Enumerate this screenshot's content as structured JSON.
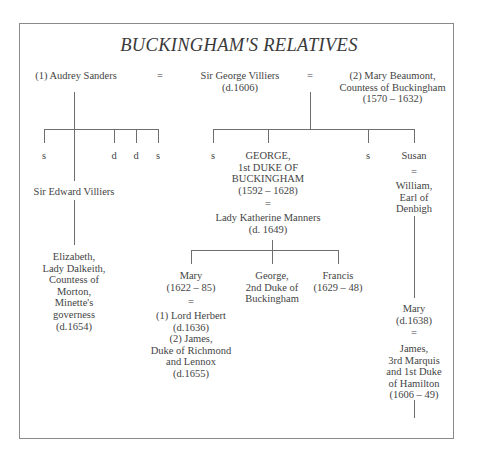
{
  "title": "BUCKINGHAM'S RELATIVES",
  "generation1": {
    "wife1": "(1) Audrey Sanders",
    "marriage1": "=",
    "husband": "Sir George Villiers\n(d.1606)",
    "marriage2": "=",
    "wife2": "(2) Mary Beaumont,\nCountess of Buckingham\n(1570 – 1632)"
  },
  "children_first_marriage": [
    "s",
    "d",
    "d",
    "s"
  ],
  "sir_edward": "Sir Edward Villiers",
  "elizabeth": "Elizabeth,\nLady Dalkeith,\nCountess of\nMorton,\nMinette's\ngoverness\n(d.1654)",
  "children_second_marriage": {
    "s1": "s",
    "george": "GEORGE,\n1st DUKE OF\nBUCKINGHAM\n(1592 – 1628)",
    "s2": "s",
    "susan": "Susan"
  },
  "george_marriage": "=",
  "katherine": "Lady Katherine Manners\n(d. 1649)",
  "susan_marriage": "=",
  "william": "William,\nEarl of\nDenbigh",
  "george_children": {
    "mary": "Mary\n(1622 – 85)",
    "george2": "George,\n2nd Duke of\nBuckingham",
    "francis": "Francis\n(1629 – 48)"
  },
  "mary_marriage": "=",
  "mary_husbands": "(1) Lord Herbert\n(d.1636)\n(2) James,\nDuke of Richmond\nand Lennox\n(d.1655)",
  "mary_denbigh": "Mary\n(d.1638)",
  "mary_denbigh_marriage": "=",
  "hamilton": "James,\n3rd Marquis\nand 1st Duke\nof Hamilton\n(1606 – 49)"
}
